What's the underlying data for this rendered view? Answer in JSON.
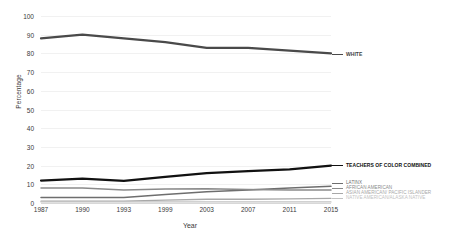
{
  "chart_data": {
    "type": "line",
    "title": "",
    "xlabel": "Year",
    "ylabel": "Percentage",
    "x": [
      1987,
      1990,
      1993,
      1999,
      2003,
      2007,
      2011,
      2015
    ],
    "xtick_labels": [
      "1987",
      "1990",
      "1993",
      "1999",
      "2003",
      "2007",
      "2011",
      "2015"
    ],
    "ytick_labels": [
      "0",
      "10",
      "20",
      "30",
      "40",
      "50",
      "60",
      "70",
      "80",
      "90",
      "100"
    ],
    "yticks": [
      0,
      10,
      20,
      30,
      40,
      50,
      60,
      70,
      80,
      90,
      100
    ],
    "ylim": [
      0,
      100
    ],
    "grid": true,
    "legend_position": "right-inline-labels",
    "series": [
      {
        "name": "WHITE",
        "color": "#4a4a4a",
        "width": 2.2,
        "values": [
          88,
          90,
          88,
          86,
          83,
          83,
          81.5,
          80
        ]
      },
      {
        "name": "TEACHERS OF COLOR COMBINED",
        "color": "#111111",
        "width": 2.2,
        "values": [
          12,
          13,
          11.8,
          14,
          16,
          17,
          18,
          20
        ]
      },
      {
        "name": "LATINX",
        "color": "#6e6e6e",
        "width": 1.5,
        "values": [
          3,
          3,
          3,
          4.5,
          6,
          7,
          8,
          9
        ]
      },
      {
        "name": "AFRICAN AMERICAN",
        "color": "#8a8a8a",
        "width": 1.5,
        "values": [
          8,
          8,
          7,
          7.5,
          7.6,
          7.2,
          7,
          7
        ]
      },
      {
        "name": "ASIAN AMERICAN/ PACIFIC ISLANDER",
        "color": "#a8a8a8",
        "width": 1.3,
        "values": [
          1,
          1,
          1,
          1.5,
          2,
          2,
          2.2,
          2.5
        ]
      },
      {
        "name": "NATIVE AMERICAN/ALASKA NATIVE",
        "color": "#c2c2c2",
        "width": 1.2,
        "values": [
          0.6,
          0.6,
          0.6,
          0.6,
          0.6,
          0.6,
          0.6,
          0.6
        ]
      }
    ]
  },
  "labels": {
    "white": "WHITE",
    "teachers_of_color": "TEACHERS OF COLOR COMBINED",
    "latinx": "LATINX",
    "african_american": "AFRICAN AMERICAN",
    "asian_pacific": "ASIAN AMERICAN/ PACIFIC ISLANDER",
    "native_american": "NATIVE AMERICAN/ALASKA NATIVE"
  }
}
